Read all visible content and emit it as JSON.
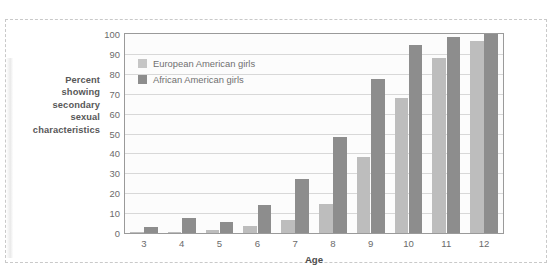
{
  "chart_data": {
    "type": "bar",
    "title": "",
    "xlabel": "Age",
    "ylabel": "Percent showing secondary sexual characteristics",
    "ylabel_lines": [
      "Percent",
      "showing",
      "secondary",
      "sexual",
      "characteristics"
    ],
    "categories": [
      "3",
      "4",
      "5",
      "6",
      "7",
      "8",
      "9",
      "10",
      "11",
      "12"
    ],
    "series": [
      {
        "name": "European American girls",
        "color": "#bdbdbd",
        "values": [
          0.5,
          0.5,
          1.5,
          3.5,
          6.5,
          14.5,
          38,
          68,
          88,
          96.5
        ]
      },
      {
        "name": "African American girls",
        "color": "#8d8d8d",
        "values": [
          3,
          7.5,
          5.5,
          14,
          27,
          48.5,
          77.5,
          94.5,
          98.5,
          100
        ]
      }
    ],
    "ylim": [
      0,
      100
    ],
    "yticks": [
      0,
      10,
      20,
      30,
      40,
      50,
      60,
      70,
      80,
      90,
      100
    ],
    "ytick_labels": [
      "0",
      "10",
      "20",
      "30",
      "40",
      "50",
      "60",
      "70",
      "80",
      "90",
      "100"
    ],
    "grid": true,
    "legend_position": "top-left-inside"
  },
  "legend": {
    "entries": [
      {
        "label": "European American girls",
        "swatch": "ea"
      },
      {
        "label": "African American girls",
        "swatch": "aa"
      }
    ]
  },
  "colors": {
    "european_american": "#bdbdbd",
    "african_american": "#8d8d8d",
    "gridline": "#d8d8d8",
    "axis": "#9a9a9a",
    "tick_text": "#6b6b6b",
    "title_text": "#4d4d4d",
    "frame_dashed": "#c9c9c9",
    "plot_background": "#fcfcfc"
  }
}
